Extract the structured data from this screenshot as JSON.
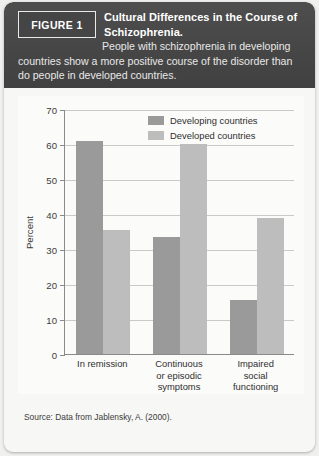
{
  "figure": {
    "badge_label": "FIGURE 1",
    "title": "Cultural Differences in the Course of Schizophrenia.",
    "subtitle": "People with schizophrenia in developing countries show a more positive course of the disorder than do people in developed countries.",
    "source": "Source: Data from Jablensky, A. (2000).",
    "colors": {
      "header_bg": "#4a4a4a",
      "card_bg": "#f7f7f5",
      "panel_bg": "#fbfbfa",
      "developing": "#9a9a9a",
      "developed": "#bdbdbd",
      "axis": "#8a8a8a",
      "grid": "#c9c9c7"
    }
  },
  "chart_data": {
    "type": "bar",
    "title": "",
    "xlabel": "",
    "ylabel": "Percent",
    "ylim": [
      0,
      70
    ],
    "yticks": [
      0,
      10,
      20,
      30,
      40,
      50,
      60,
      70
    ],
    "ytick_labels": [
      "0",
      "10",
      "20",
      "30",
      "40",
      "50",
      "60",
      "70"
    ],
    "grid": true,
    "grid_axis": "y",
    "legend_position": "top-right",
    "categories": [
      "In remission",
      "Continuous or episodic symptoms",
      "Impaired social functioning"
    ],
    "category_lines": [
      [
        "In remission"
      ],
      [
        "Continuous",
        "or episodic",
        "symptoms"
      ],
      [
        "Impaired",
        "social",
        "functioning"
      ]
    ],
    "series": [
      {
        "name": "Developing countries",
        "color": "#9a9a9a",
        "values": [
          61,
          33.5,
          15.5
        ]
      },
      {
        "name": "Developed countries",
        "color": "#bdbdbd",
        "values": [
          35.5,
          60,
          39
        ]
      }
    ]
  }
}
